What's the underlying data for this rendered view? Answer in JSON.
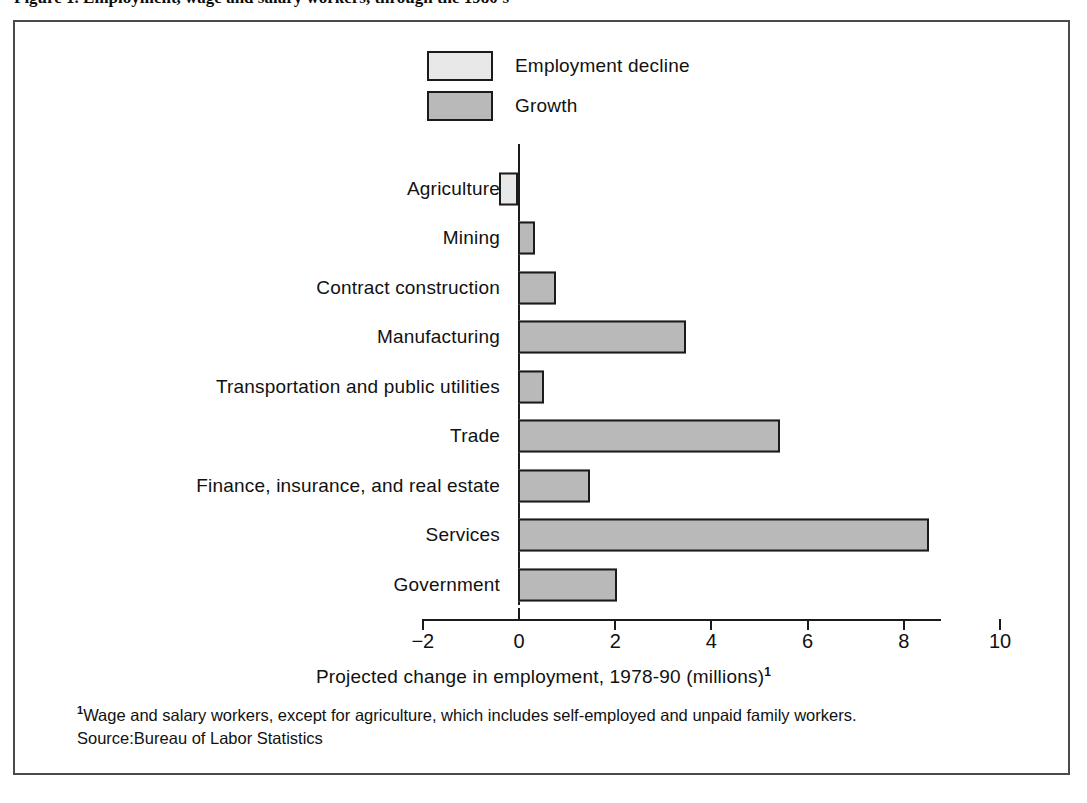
{
  "figure": {
    "title_partial": "Figure 1.  Employment, wage and salary workers, through the 1980's"
  },
  "legend": {
    "position": "top-center",
    "items": [
      {
        "label": "Employment decline",
        "color": "#e8e8e8",
        "key": "decline"
      },
      {
        "label": "Growth",
        "color": "#b9b9b9",
        "key": "growth"
      }
    ]
  },
  "axis": {
    "x_title_text": "Projected change in employment, 1978-90 (millions)",
    "x_title_superscript": "1",
    "ticks": [
      "−2",
      "0",
      "2",
      "4",
      "6",
      "8",
      "10"
    ]
  },
  "footnote": {
    "marker": "1",
    "text": "Wage and salary workers, except for agriculture, which includes self-employed and  unpaid family workers.",
    "source": "Source:Bureau of Labor Statistics"
  },
  "colors": {
    "decline": "#e8e8e8",
    "growth": "#b9b9b9",
    "ink": "#1b1b1b",
    "frame": "#4a4a4a",
    "background": "#ffffff"
  },
  "chart_data": {
    "type": "bar",
    "orientation": "horizontal",
    "title": "Projected change in employment, 1978-90 (millions)",
    "xlabel": "Projected change in employment, 1978-90 (millions)",
    "ylabel": "",
    "xlim": [
      -2,
      10
    ],
    "xticks": [
      -2,
      0,
      2,
      4,
      6,
      8,
      10
    ],
    "grid": false,
    "legend": [
      "Employment decline",
      "Growth"
    ],
    "categories": [
      "Agriculture",
      "Mining",
      "Contract construction",
      "Manufacturing",
      "Transportation and public utilities",
      "Trade",
      "Finance, insurance, and real estate",
      "Services",
      "Government"
    ],
    "values": [
      -0.4,
      0.35,
      0.8,
      3.5,
      0.55,
      5.45,
      1.5,
      8.55,
      2.05
    ],
    "series_key": [
      "decline",
      "growth",
      "growth",
      "growth",
      "growth",
      "growth",
      "growth",
      "growth",
      "growth"
    ]
  }
}
